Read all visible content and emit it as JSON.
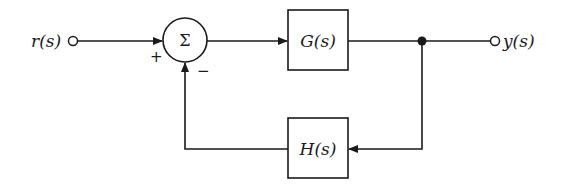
{
  "diagram": {
    "type": "feedback-control-loop",
    "input": {
      "label": "r(s)"
    },
    "output": {
      "label": "y(s)"
    },
    "summing_junction": {
      "symbol": "Σ",
      "signs": {
        "input": "+",
        "feedback": "−"
      }
    },
    "blocks": {
      "forward": {
        "label": "G(s)"
      },
      "feedback": {
        "label": "H(s)"
      }
    },
    "colors": {
      "ink": "#1a1a1a",
      "background": "#ffffff"
    }
  }
}
